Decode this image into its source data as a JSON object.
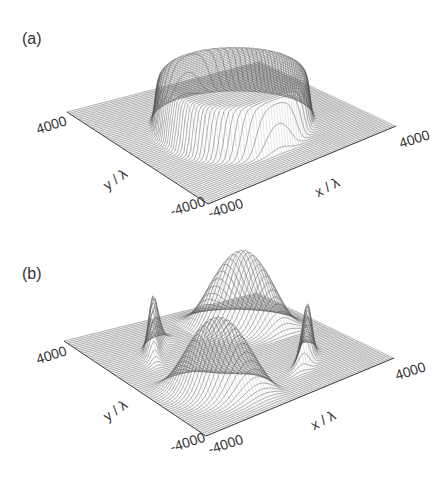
{
  "figure": {
    "panels": [
      {
        "label": "(a)",
        "surface": "flat-top cylinder",
        "ticks": {
          "y_max": "4000",
          "y_min": "-4000",
          "x_min": "-4000",
          "x_max": "4000"
        },
        "axis_labels": {
          "x": "x / λ",
          "y": "y / λ"
        }
      },
      {
        "label": "(b)",
        "surface": "four lobes on a ring",
        "ticks": {
          "y_max": "4000",
          "y_min": "-4000",
          "x_min": "-4000",
          "x_max": "4000"
        },
        "axis_labels": {
          "x": "x / λ",
          "y": "y / λ"
        }
      }
    ]
  },
  "chart_data": [
    {
      "type": "surface",
      "title": "(a)",
      "xlabel": "x / λ",
      "ylabel": "y / λ",
      "xlim": [
        -4000,
        4000
      ],
      "ylim": [
        -4000,
        4000
      ],
      "shape": "cylindrical top-hat: constant height inside radius ≈ 2700, zero outside",
      "grid": "wireframe mesh"
    },
    {
      "type": "surface",
      "title": "(b)",
      "xlabel": "x / λ",
      "ylabel": "y / λ",
      "xlim": [
        -4000,
        4000
      ],
      "ylim": [
        -4000,
        4000
      ],
      "shape": "annular ring of radius ≈ 2700 with four peaks at back, front, left and right; peaks at left/right are narrow and sharp, front/back broad",
      "grid": "wireframe mesh"
    }
  ],
  "colors": {
    "mesh": "#555555",
    "background": "#ffffff",
    "text": "#333333"
  }
}
